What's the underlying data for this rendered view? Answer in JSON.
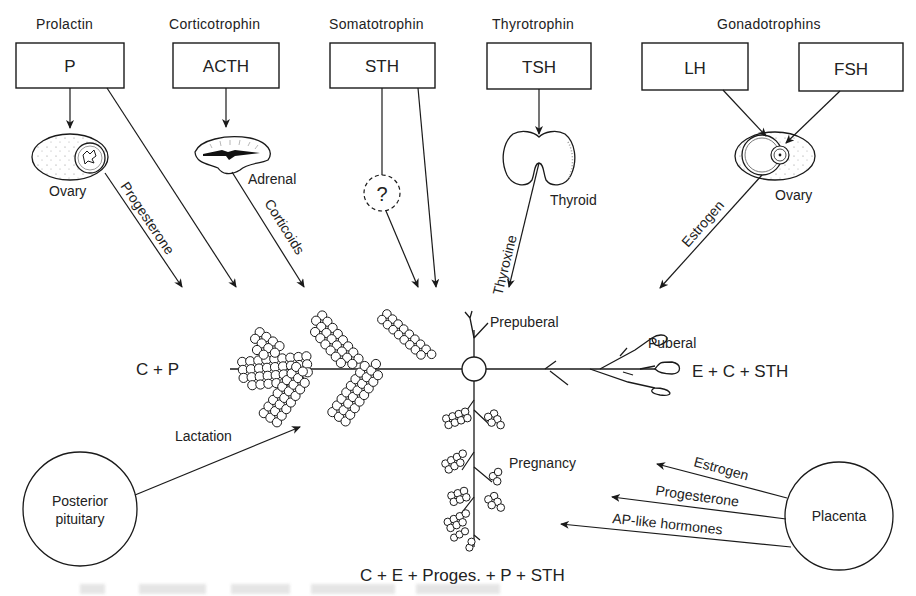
{
  "diagram": {
    "hormone_sources": [
      {
        "header": "Prolactin",
        "box": "P"
      },
      {
        "header": "Corticotrophin",
        "box": "ACTH"
      },
      {
        "header": "Somatotrophin",
        "box": "STH"
      },
      {
        "header": "Thyrotrophin",
        "box": "TSH"
      },
      {
        "header": "Gonadotrophins",
        "boxes": [
          "LH",
          "FSH"
        ]
      }
    ],
    "organs": {
      "ovary_left": "Ovary",
      "adrenal": "Adrenal",
      "unknown": "?",
      "thyroid": "Thyroid",
      "ovary_right": "Ovary",
      "posterior_pituitary": "Posterior\npituitary",
      "posterior_pituitary_line1": "Posterior",
      "posterior_pituitary_line2": "pituitary",
      "placenta": "Placenta"
    },
    "arrow_labels": {
      "progesterone": "Progesterone",
      "corticoids": "Corticoids",
      "thyroxine": "Thyroxine",
      "estrogen": "Estrogen",
      "lactation": "Lactation",
      "placenta_estrogen": "Estrogen",
      "placenta_progesterone": "Progesterone",
      "placenta_ap": "AP-like hormones"
    },
    "stages": {
      "prepuberal": "Prepuberal",
      "puberal": "Puberal",
      "pregnancy": "Pregnancy"
    },
    "formulas": {
      "lactation": "C + P",
      "puberal": "E + C + STH",
      "pregnancy": "C + E + Proges. + P + STH"
    }
  }
}
